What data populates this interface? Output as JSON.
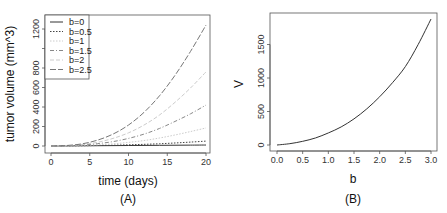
{
  "chart_data": [
    {
      "type": "line",
      "panel_label": "(A)",
      "xlabel": "time (days)",
      "ylabel": "tumor volume (mm^3)",
      "xlim": [
        0,
        20
      ],
      "ylim": [
        0,
        1300
      ],
      "xticks": [
        "0",
        "5",
        "10",
        "15",
        "20"
      ],
      "yticks": [
        "0",
        "200",
        "400",
        "600",
        "800",
        "1000",
        "1200"
      ],
      "grid": false,
      "legend_position": "top-left",
      "x": [
        0,
        2,
        4,
        6,
        8,
        10,
        12,
        14,
        16,
        18,
        20
      ],
      "series": [
        {
          "name": "b=0",
          "style": "solid",
          "color": "#333333",
          "values": [
            0,
            1,
            2,
            3,
            4,
            5,
            6,
            7,
            8,
            9,
            10
          ]
        },
        {
          "name": "b=0.5",
          "style": "dotted",
          "color": "#444444",
          "values": [
            0,
            1,
            3,
            5,
            8,
            12,
            17,
            23,
            31,
            40,
            50
          ]
        },
        {
          "name": "b=1",
          "style": "dotted",
          "color": "#cccccc",
          "values": [
            0,
            2,
            6,
            12,
            22,
            37,
            56,
            82,
            113,
            148,
            185
          ]
        },
        {
          "name": "b=1.5",
          "style": "dashdot",
          "color": "#888888",
          "values": [
            0,
            3,
            10,
            24,
            45,
            78,
            122,
            180,
            252,
            330,
            420
          ]
        },
        {
          "name": "b=2",
          "style": "dashed",
          "color": "#cccccc",
          "values": [
            0,
            4,
            15,
            38,
            78,
            135,
            215,
            318,
            448,
            595,
            760
          ]
        },
        {
          "name": "b=2.5",
          "style": "longdash",
          "color": "#777777",
          "values": [
            0,
            5,
            22,
            60,
            122,
            215,
            345,
            515,
            725,
            970,
            1240
          ]
        }
      ]
    },
    {
      "type": "line",
      "panel_label": "(B)",
      "xlabel": "b",
      "ylabel": "V",
      "xlim": [
        0,
        3
      ],
      "ylim": [
        0,
        1900
      ],
      "xticks": [
        "0.0",
        "0.5",
        "1.0",
        "1.5",
        "2.0",
        "2.5",
        "3.0"
      ],
      "yticks": [
        "0",
        "500",
        "1000",
        "1500"
      ],
      "grid": false,
      "x": [
        0,
        0.25,
        0.5,
        0.75,
        1.0,
        1.25,
        1.5,
        1.75,
        2.0,
        2.25,
        2.5,
        2.75,
        3.0
      ],
      "series": [
        {
          "name": "V",
          "style": "solid",
          "color": "#333333",
          "values": [
            0,
            20,
            55,
            105,
            180,
            270,
            390,
            540,
            720,
            930,
            1170,
            1500,
            1880
          ]
        }
      ]
    }
  ]
}
